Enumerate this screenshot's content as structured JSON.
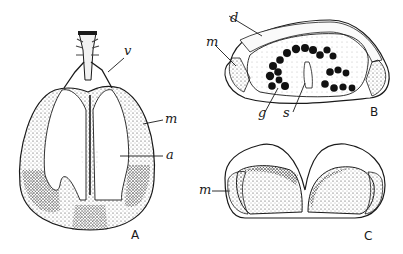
{
  "figure": {
    "panels": [
      {
        "id": "A",
        "label": "A",
        "structure_labels": {
          "v": "v",
          "m": "m",
          "a": "a"
        }
      },
      {
        "id": "B",
        "label": "B",
        "structure_labels": {
          "d": "d",
          "m": "m",
          "g": "g",
          "s": "s"
        }
      },
      {
        "id": "C",
        "label": "C",
        "structure_labels": {
          "m": "m"
        }
      }
    ],
    "colors": {
      "ink": "#1a1a1a",
      "background": "#ffffff",
      "stipple": "#555555"
    }
  }
}
